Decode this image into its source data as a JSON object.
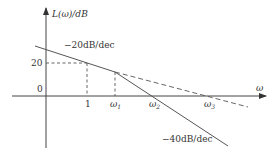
{
  "diagram": {
    "type": "bode-magnitude-asymptote",
    "y_axis_label": "L(ω)/dB",
    "x_axis_label": "ω",
    "y_ticks": [
      {
        "label": "20",
        "value": 20
      },
      {
        "label": "0",
        "value": 0
      }
    ],
    "x_ticks": [
      {
        "label": "1"
      },
      {
        "label": "ω",
        "subscript": "1"
      },
      {
        "label": "ω",
        "subscript": "2"
      },
      {
        "label": "ω",
        "subscript": "3"
      }
    ],
    "slope_labels": {
      "first": "−20dB/dec",
      "second": "−40dB/dec"
    },
    "colors": {
      "line": "#555555",
      "text": "#333333",
      "background": "#ffffff"
    }
  }
}
